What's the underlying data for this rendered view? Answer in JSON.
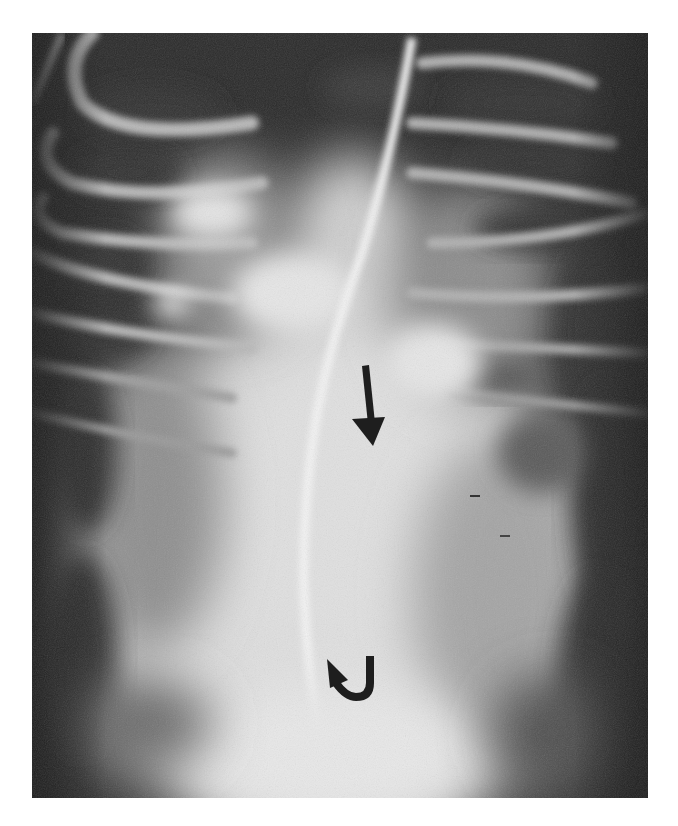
{
  "figure": {
    "type": "radiograph",
    "view": "frontal chest x-ray",
    "colors": {
      "background": "#2b2b2b",
      "soft_tissue": "#d9d9d9",
      "arrow": "#1e1e1e",
      "page": "#ffffff"
    },
    "annotations": [
      {
        "id": "straight-arrow",
        "kind": "straight arrow",
        "direction": "down",
        "x": 369,
        "y": 405
      },
      {
        "id": "curved-arrow",
        "kind": "curved arrow",
        "direction": "up-left",
        "x": 350,
        "y": 676
      }
    ]
  },
  "caption": {
    "text": "",
    "note": "Caption line is cut off at bottom edge; only tops of glyphs visible and illegible"
  }
}
